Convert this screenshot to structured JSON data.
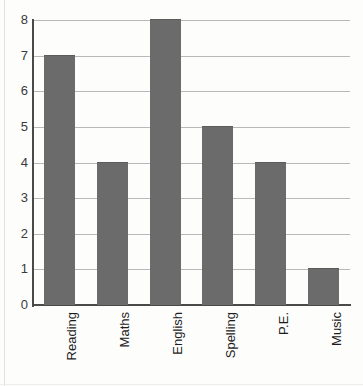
{
  "chart_data": {
    "type": "bar",
    "title": "",
    "subtitle": "",
    "xlabel": "",
    "ylabel": "",
    "categories": [
      "Reading",
      "Maths",
      "English",
      "Spelling",
      "P.E.",
      "Music"
    ],
    "values": [
      7,
      4,
      8,
      5,
      4,
      1
    ],
    "ylim": [
      0,
      8
    ],
    "ytick_labels": [
      "8",
      "7",
      "6",
      "5",
      "4",
      "3",
      "2",
      "1",
      "0"
    ],
    "ytick_values": [
      8,
      7,
      6,
      5,
      4,
      3,
      2,
      1,
      0
    ],
    "grid": true,
    "grid_axis": "y",
    "legend": false,
    "legend_position": "none",
    "label_rotation": 90,
    "colors": {
      "bar_fill": "#6b6b6b",
      "bar_edge": "#5c5c5c",
      "gridline": "#b9b9b9",
      "axis": "#4a4a4a",
      "background": "#fdfdfc",
      "tick_text": "#3a3a3a",
      "category_text": "#1c1c1c"
    }
  }
}
